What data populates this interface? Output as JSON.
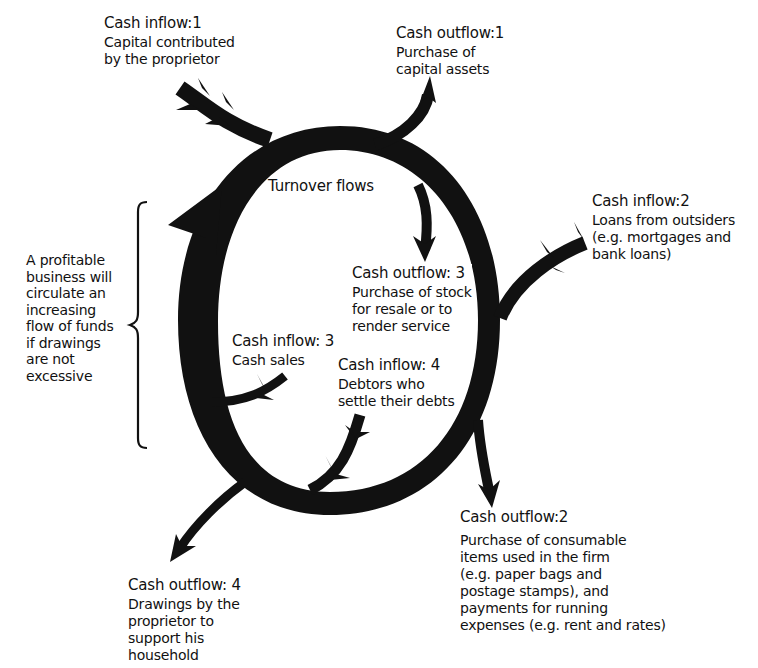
{
  "diagram": {
    "center_label": "Turnover flows",
    "side_note": {
      "lines": [
        "A profitable",
        "business will",
        "circulate an",
        "increasing",
        "flow of funds",
        "if drawings",
        "are not",
        "excessive"
      ]
    },
    "nodes": {
      "inflow_1": {
        "heading": "Cash inflow:1",
        "lines": [
          "Capital contributed",
          "by the proprietor"
        ]
      },
      "outflow_1": {
        "heading": "Cash outflow:1",
        "lines": [
          "Purchase of",
          "capital assets"
        ]
      },
      "inflow_2": {
        "heading": "Cash inflow:2",
        "lines": [
          "Loans from outsiders",
          "(e.g. mortgages and",
          "bank loans)"
        ]
      },
      "outflow_3": {
        "heading": "Cash outflow: 3",
        "lines": [
          "Purchase of stock",
          "for resale or to",
          "render service"
        ]
      },
      "inflow_3": {
        "heading": "Cash inflow: 3",
        "lines": [
          "Cash sales"
        ]
      },
      "inflow_4": {
        "heading": "Cash inflow: 4",
        "lines": [
          "Debtors who",
          "settle their debts"
        ]
      },
      "outflow_2": {
        "heading": "Cash outflow:2",
        "lines": [
          "Purchase of consumable",
          "items used in the firm",
          "(e.g. paper bags and",
          "postage stamps), and",
          "payments for running",
          "expenses (e.g. rent and rates)"
        ]
      },
      "outflow_4": {
        "heading": "Cash outflow: 4",
        "lines": [
          "Drawings by the",
          "proprietor to",
          "support his",
          "household"
        ]
      }
    },
    "colors": {
      "ink": "#111111",
      "background": "#ffffff"
    }
  }
}
